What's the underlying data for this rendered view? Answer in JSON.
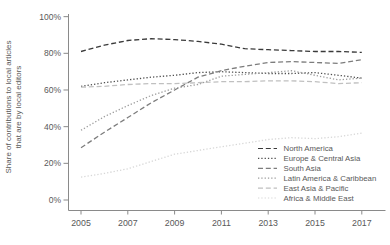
{
  "colors": {
    "background": "#ffffff",
    "axis": "#8a8a8a",
    "tick_text": "#595959",
    "legend_text": "#595959"
  },
  "chart_data": {
    "type": "line",
    "title": "",
    "xlabel": "",
    "ylabel_lines": [
      "Share of contributions to local articles",
      "that are by local editors"
    ],
    "x": [
      2005,
      2006,
      2007,
      2008,
      2009,
      2010,
      2011,
      2012,
      2013,
      2014,
      2015,
      2016,
      2017
    ],
    "x_tick_labels": [
      "2005",
      "2007",
      "2009",
      "2011",
      "2013",
      "2015",
      "2017"
    ],
    "x_ticks": [
      2005,
      2007,
      2009,
      2011,
      2013,
      2015,
      2017
    ],
    "y_tick_labels": [
      "0%",
      "20%",
      "40%",
      "60%",
      "80%",
      "100%"
    ],
    "y_ticks": [
      0,
      20,
      40,
      60,
      80,
      100
    ],
    "ylim": [
      0,
      100
    ],
    "grid": false,
    "legend_position": "inside-bottom-right",
    "series": [
      {
        "name": "North America",
        "style": "dashed",
        "color": "#3a3a3a",
        "values": [
          81,
          84.5,
          87,
          88,
          87.5,
          86.5,
          85,
          82.5,
          82,
          81.5,
          81,
          81,
          80.5
        ]
      },
      {
        "name": "Europe & Central Asia",
        "style": "dotted",
        "color": "#4f4f4f",
        "values": [
          62,
          64,
          65.5,
          67,
          68,
          69.5,
          70,
          69.5,
          69,
          69,
          69.5,
          68,
          66.5
        ]
      },
      {
        "name": "South Asia",
        "style": "dashed",
        "color": "#7d7d7d",
        "values": [
          28.5,
          37,
          45,
          53,
          60,
          67,
          70.5,
          73,
          75,
          75.5,
          75,
          74.5,
          76.5
        ]
      },
      {
        "name": "Latin America & Caribbean",
        "style": "dotted",
        "color": "#9c9c9c",
        "values": [
          38,
          45.5,
          51.5,
          57,
          61,
          63,
          67.5,
          68.5,
          69.5,
          70.5,
          68,
          65.5,
          66.5
        ]
      },
      {
        "name": "East Asia & Pacific",
        "style": "dashed",
        "color": "#c0c0c0",
        "values": [
          61.5,
          62,
          63,
          63.5,
          63.5,
          64,
          64.5,
          64.5,
          65,
          65,
          64.5,
          63.5,
          64
        ]
      },
      {
        "name": "Africa & Middle East",
        "style": "dotted",
        "color": "#d7d7d7",
        "values": [
          12.5,
          14.5,
          17,
          21,
          25,
          27,
          29,
          31,
          33,
          34,
          33.5,
          34.5,
          36.5
        ]
      }
    ]
  }
}
